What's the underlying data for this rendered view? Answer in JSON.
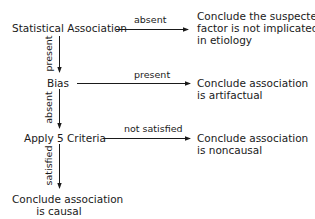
{
  "nodes": {
    "statistical_association": "Statistical Association",
    "bias": "Bias",
    "apply_criteria": "Apply 5 Criteria",
    "conclude_causal": [
      "Conclude association",
      "is causal"
    ],
    "conclude_not_implicated": [
      "Conclude the suspected",
      "factor is not implicated",
      "in etiology"
    ],
    "conclude_artifactual": [
      "Conclude association",
      "is artifactual"
    ],
    "conclude_noncausal": [
      "Conclude association",
      "is noncausal"
    ]
  },
  "edges": {
    "assoc_absent": "absent",
    "assoc_present": "present",
    "bias_present": "present",
    "bias_absent": "absent",
    "criteria_not_satisfied": "not satisfied",
    "criteria_satisfied": "satisfied"
  }
}
